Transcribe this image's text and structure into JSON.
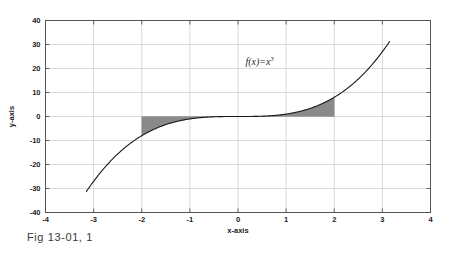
{
  "figure": {
    "caption": "Fig 13-01, 1"
  },
  "chart_data": {
    "type": "line",
    "title": "",
    "annotation": "f(x)=x",
    "annotation_exponent": "3",
    "annotation_x": 0.45,
    "annotation_y": 21.5,
    "xlabel": "x-axis",
    "ylabel": "y-axis",
    "xlim": [
      -4,
      4
    ],
    "ylim": [
      -40,
      40
    ],
    "xticks": [
      -4,
      -3,
      -2,
      -1,
      0,
      1,
      2,
      3,
      4
    ],
    "xticklabels": [
      "-4",
      "-3",
      "-2",
      "-1",
      "0",
      "1",
      "2",
      "3",
      "4"
    ],
    "yticks": [
      -40,
      -30,
      -20,
      -10,
      0,
      10,
      20,
      30,
      40
    ],
    "yticklabels": [
      "-40",
      "-30",
      "-20",
      "-10",
      "0",
      "10",
      "20",
      "30",
      "40"
    ],
    "grid": true,
    "legend": null,
    "series": [
      {
        "name": "f(x)=x^3",
        "formula": "x**3",
        "color": "#1a1a1a",
        "linewidth": 1.1,
        "x_start": -3.15,
        "x_end": 3.15,
        "x": [
          -3.15,
          -3.0,
          -2.8,
          -2.6,
          -2.4,
          -2.2,
          -2.0,
          -1.8,
          -1.6,
          -1.4,
          -1.2,
          -1.0,
          -0.8,
          -0.6,
          -0.4,
          -0.2,
          0.0,
          0.2,
          0.4,
          0.6,
          0.8,
          1.0,
          1.2,
          1.4,
          1.6,
          1.8,
          2.0,
          2.2,
          2.4,
          2.6,
          2.8,
          3.0,
          3.15
        ],
        "y": [
          -31.26,
          -27.0,
          -21.95,
          -17.58,
          -13.82,
          -10.65,
          -8.0,
          -5.83,
          -4.1,
          -2.74,
          -1.73,
          -1.0,
          -0.51,
          -0.22,
          -0.06,
          -0.01,
          0.0,
          0.01,
          0.06,
          0.22,
          0.51,
          1.0,
          1.73,
          2.74,
          4.1,
          5.83,
          8.0,
          10.65,
          13.82,
          17.58,
          21.95,
          27.0,
          31.26
        ]
      }
    ],
    "shaded_regions": [
      {
        "name": "left-shaded-area",
        "x_from": -2,
        "x_to": 0,
        "between": "curve-and-zero",
        "fill": "#8a8a8a",
        "description": "Area between f(x)=x^3 and y=0 from x=-2 to x=0 (below axis)"
      },
      {
        "name": "right-shaded-area",
        "x_from": 0,
        "x_to": 2,
        "between": "curve-and-zero",
        "fill": "#8a8a8a",
        "description": "Area between f(x)=x^3 and y=0 from x=0 to x=2 (above axis)"
      }
    ],
    "colors": {
      "axis": "#555555",
      "grid": "#c8c8d0",
      "curve": "#1a1a1a",
      "shade": "#8a8a8a",
      "background": "#ffffff"
    }
  }
}
